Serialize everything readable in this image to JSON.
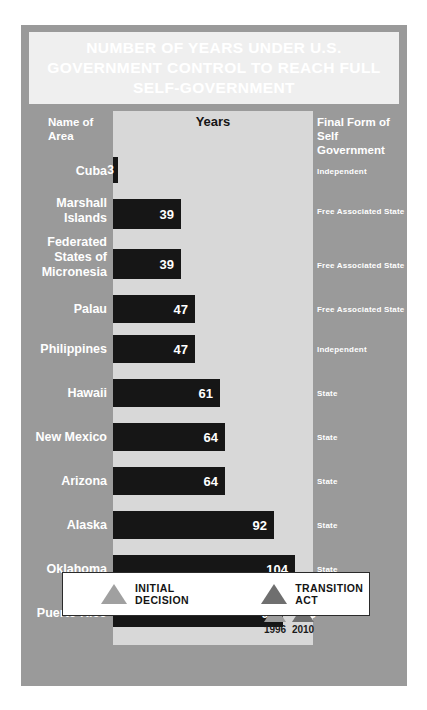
{
  "title": "NUMBER OF YEARS UNDER U.S. GOVERNMENT CONTROL TO REACH FULL SELF-GOVERNMENT",
  "headers": {
    "name": "Name of\nArea",
    "name_line1": "Name of",
    "name_line2": "Area",
    "years": "Years",
    "final_line1": "Final Form of Self",
    "final_line2": "Government"
  },
  "colors": {
    "frame": "#9a9a9a",
    "title_panel": "#efefef",
    "years_band": "#d8d8d8",
    "bar": "#161616",
    "marker_initial": "#9d9d9d",
    "marker_transition": "#6f6f6f",
    "legend_bg": "#ffffff"
  },
  "markers": [
    {
      "label": "1996",
      "type": "initial-decision-marker",
      "year_value": 97
    },
    {
      "label": "2010",
      "type": "transition-act-marker",
      "year_value": 113
    }
  ],
  "legend": {
    "items": [
      {
        "label": "INITIAL DECISION",
        "swatch": "triangle-light"
      },
      {
        "label": "TRANSITION ACT",
        "swatch": "triangle-dark"
      }
    ]
  },
  "chart_data": {
    "type": "bar",
    "title": "NUMBER OF YEARS UNDER U.S. GOVERNMENT CONTROL TO REACH FULL SELF-GOVERNMENT",
    "xlabel": "Years",
    "ylabel": "Name of Area",
    "orientation": "horizontal",
    "grid": false,
    "legend_position": "bottom",
    "xlim": [
      0,
      120
    ],
    "categories": [
      "Cuba",
      "Marshall Islands",
      "Federated States of Micronesia",
      "Palau",
      "Philippines",
      "Hawaii",
      "New Mexico",
      "Arizona",
      "Alaska",
      "Oklahoma",
      "Puerto Rico"
    ],
    "values": [
      3,
      39,
      39,
      47,
      47,
      61,
      64,
      64,
      92,
      104,
      97
    ],
    "final_forms": [
      "Independent",
      "Free Associated State",
      "Free Associated State",
      "Free Associated State",
      "Independent",
      "State",
      "State",
      "State",
      "State",
      "State",
      "????"
    ],
    "annotations": [
      {
        "category": "Puerto Rico",
        "value": 113,
        "label": "113",
        "note": "projected / transition act"
      }
    ]
  },
  "rows": [
    {
      "name": "Cuba",
      "name_lines": [
        "Cuba"
      ],
      "value": 3,
      "value_label": "3",
      "final": "Independent"
    },
    {
      "name": "Marshall Islands",
      "name_lines": [
        "Marshall",
        "Islands"
      ],
      "value": 39,
      "value_label": "39",
      "final": "Free Associated State"
    },
    {
      "name": "Federated States of Micronesia",
      "name_lines": [
        "Federated",
        "States of",
        "Micronesia"
      ],
      "value": 39,
      "value_label": "39",
      "final": "Free Associated State"
    },
    {
      "name": "Palau",
      "name_lines": [
        "Palau"
      ],
      "value": 47,
      "value_label": "47",
      "final": "Free Associated State"
    },
    {
      "name": "Philippines",
      "name_lines": [
        "Philippines"
      ],
      "value": 47,
      "value_label": "47",
      "final": "Independent"
    },
    {
      "name": "Hawaii",
      "name_lines": [
        "Hawaii"
      ],
      "value": 61,
      "value_label": "61",
      "final": "State"
    },
    {
      "name": "New Mexico",
      "name_lines": [
        "New Mexico"
      ],
      "value": 64,
      "value_label": "64",
      "final": "State"
    },
    {
      "name": "Arizona",
      "name_lines": [
        "Arizona"
      ],
      "value": 64,
      "value_label": "64",
      "final": "State"
    },
    {
      "name": "Alaska",
      "name_lines": [
        "Alaska"
      ],
      "value": 92,
      "value_label": "92",
      "final": "State"
    },
    {
      "name": "Oklahoma",
      "name_lines": [
        "Oklahoma"
      ],
      "value": 104,
      "value_label": "104",
      "final": "State"
    },
    {
      "name": "Puerto Rico",
      "name_lines": [
        "Puerto Rico"
      ],
      "value": 97,
      "value_label": "97",
      "extra_value_label": "113",
      "final": "????"
    }
  ]
}
